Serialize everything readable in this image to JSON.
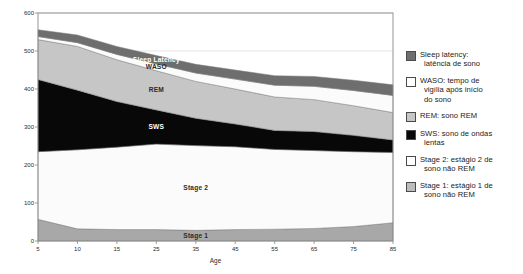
{
  "chart_data": {
    "type": "area",
    "title": "",
    "xlabel": "Age",
    "ylabel": "",
    "stacked": true,
    "grid": true,
    "legend_position": "right",
    "xlim": [
      5,
      85
    ],
    "ylim": [
      0,
      600
    ],
    "x": [
      5,
      10,
      15,
      25,
      35,
      45,
      55,
      65,
      75,
      85
    ],
    "xtick_labels": [
      "5",
      "10",
      "15",
      "25",
      "35",
      "45",
      "55",
      "65",
      "75",
      "85"
    ],
    "ytick_labels": [
      "0",
      "100",
      "200",
      "300",
      "400",
      "500",
      "600"
    ],
    "yticks": [
      0,
      100,
      200,
      300,
      400,
      500,
      600
    ],
    "series": [
      {
        "name": "Stage 1",
        "key": "stage1",
        "color": "#a8a8a8",
        "label_in_plot": "Stage 1",
        "values": [
          57,
          32,
          30,
          30,
          28,
          30,
          31,
          33,
          38,
          48
        ]
      },
      {
        "name": "Stage 2",
        "key": "stage2",
        "color": "#fbfbfb",
        "label_in_plot": "Stage 2",
        "values": [
          178,
          208,
          217,
          225,
          223,
          218,
          210,
          205,
          197,
          185
        ]
      },
      {
        "name": "SWS",
        "key": "sws",
        "color": "#080808",
        "label_in_plot": "SWS",
        "values": [
          190,
          157,
          120,
          90,
          72,
          60,
          50,
          50,
          43,
          33
        ]
      },
      {
        "name": "REM",
        "key": "rem",
        "color": "#c6c6c6",
        "label_in_plot": "REM",
        "values": [
          105,
          115,
          110,
          103,
          97,
          92,
          88,
          84,
          78,
          72
        ]
      },
      {
        "name": "WASO",
        "key": "waso",
        "color": "#fbfbfb",
        "label_in_plot": "WASO",
        "values": [
          8,
          10,
          14,
          18,
          22,
          26,
          31,
          35,
          40,
          45
        ]
      },
      {
        "name": "Sleep Latency",
        "key": "sleep_latency",
        "color": "#6e6e6e",
        "label_in_plot": "Sleep Latency",
        "values": [
          18,
          20,
          21,
          22,
          23,
          24,
          25,
          26,
          27,
          28
        ]
      }
    ],
    "legend": [
      {
        "swatch_color": "#6e6e6e",
        "line1": "Sleep latency:",
        "line2": "latência de sono"
      },
      {
        "swatch_color": "#ffffff",
        "line1": "WASO: tempo de",
        "line2": "vigília após início",
        "line3": "do sono"
      },
      {
        "swatch_color": "#c6c6c6",
        "line1": "REM: sono REM",
        "line2": ""
      },
      {
        "swatch_color": "#080808",
        "line1": "SWS: sono de ondas",
        "line2": "lentas"
      },
      {
        "swatch_color": "#ffffff",
        "line1": "Stage 2: estágio 2 de",
        "line2": "sono não REM"
      },
      {
        "swatch_color": "#bdbdbd",
        "line1": "Stage 1: estágio 1 de",
        "line2": "sono não REM"
      }
    ]
  },
  "colors": {
    "plot_border": "#8a8a8a",
    "grid": "#d4d4d4",
    "text": "#2b2b2b",
    "background": "#ffffff"
  }
}
